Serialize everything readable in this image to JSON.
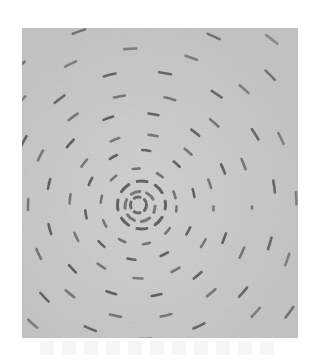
{
  "image": {
    "subject": "concentric circular rings of short dark dash-like marks converging on a central spiral",
    "palette": {
      "page_background": "#ffffff",
      "photo_background": "#c6c6c6",
      "photo_light_patch": "#d2d2d2",
      "stroke_dark": "#3c3c3c",
      "stroke_mid": "#5a5a5a"
    },
    "center": {
      "x": 140,
      "y": 205
    },
    "rings": [
      {
        "r": 8,
        "dash": "6 5",
        "offset": 0,
        "width": 3,
        "opacity": 0.75
      },
      {
        "r": 15,
        "dash": "9 7",
        "offset": 3,
        "width": 3,
        "opacity": 0.8
      },
      {
        "r": 24,
        "dash": "10 9",
        "offset": 6,
        "width": 3,
        "opacity": 0.8
      },
      {
        "r": 38,
        "dash": "7 18",
        "offset": 2,
        "width": 2.6,
        "opacity": 0.85
      },
      {
        "r": 55,
        "dash": "8 26",
        "offset": 11,
        "width": 2.6,
        "opacity": 0.8
      },
      {
        "r": 72,
        "dash": "9 30",
        "offset": 5,
        "width": 2.6,
        "opacity": 0.8
      },
      {
        "r": 92,
        "dash": "10 36",
        "offset": 17,
        "width": 2.6,
        "opacity": 0.8
      },
      {
        "r": 112,
        "dash": "11 40",
        "offset": 9,
        "width": 2.6,
        "opacity": 0.8
      },
      {
        "r": 134,
        "dash": "12 44",
        "offset": 23,
        "width": 2.6,
        "opacity": 0.75
      },
      {
        "r": 158,
        "dash": "12 50",
        "offset": 14,
        "width": 2.6,
        "opacity": 0.7
      },
      {
        "r": 184,
        "dash": "13 56",
        "offset": 30,
        "width": 2.6,
        "opacity": 0.65
      },
      {
        "r": 212,
        "dash": "14 62",
        "offset": 8,
        "width": 2.6,
        "opacity": 0.6
      }
    ]
  }
}
